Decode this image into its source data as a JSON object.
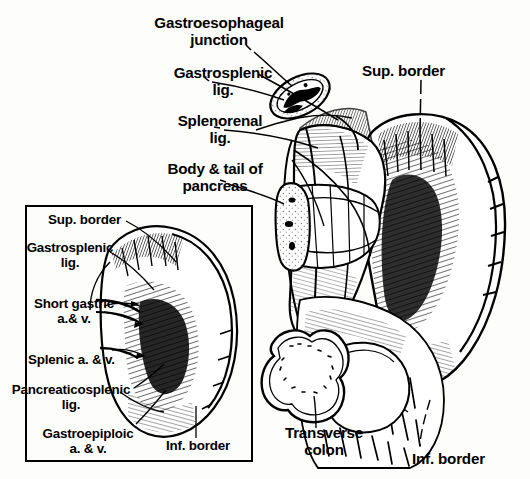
{
  "figure": {
    "title_text": "Spleen anatomy diagram with pancreas, gastroesophageal junction and transverse colon",
    "background_color": "#fdfdfb",
    "ink_color": "#000000",
    "style": "black-and-white engraved line drawing"
  },
  "main_labels": {
    "gastroesophageal_junction": "Gastroesophageal\njunction",
    "gastrosplenic_lig": "Gastrosplenic\nlig.",
    "splenorenal_lig": "Splenorenal\nlig.",
    "body_tail_pancreas": "Body & tail of\npancreas",
    "sup_border": "Sup. border",
    "spleen": "Spleen",
    "transverse_colon": "Transverse\ncolon",
    "inf_border": "Inf. border"
  },
  "inset_labels": {
    "sup_border": "Sup. border",
    "gastrosplenic_lig": "Gastrosplenic\nlig.",
    "short_gastric": "Short gastric\na.& v.",
    "splenic_av": "Splenic a. & v.",
    "pancreaticosplenic_lig": "Pancreaticosplenic\nlig.",
    "gastroepiploic": "Gastroepiploic\na. & v.",
    "inf_border": "Inf. border"
  },
  "inset": {
    "caption_role": "isolated spleen visceral surface with hilar vessels",
    "border_color": "#000000"
  }
}
